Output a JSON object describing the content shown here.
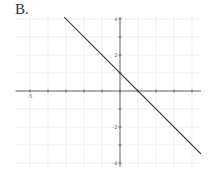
{
  "figure": {
    "option_label": "B."
  },
  "chart_data": {
    "type": "line",
    "title": "",
    "xlabel": "",
    "ylabel": "",
    "xlim": [
      -5.8,
      4.5
    ],
    "ylim": [
      -4.2,
      4.1
    ],
    "grid": true,
    "x_ticks": [
      -5,
      -4,
      -3,
      -2,
      -1,
      0,
      1,
      2,
      3,
      4
    ],
    "y_ticks": [
      -4,
      -3,
      -2,
      -1,
      1,
      2,
      3,
      4
    ],
    "x_tick_labels": [
      {
        "value": -5,
        "text": "-5"
      }
    ],
    "y_tick_labels": [
      {
        "value": 4,
        "text": "4"
      },
      {
        "value": 2,
        "text": "2"
      },
      {
        "value": -2,
        "text": "-2"
      },
      {
        "value": -4,
        "text": "-4"
      }
    ],
    "series": [
      {
        "name": "y = -x + 1",
        "equation": "y = -x + 1",
        "slope": -1,
        "y_intercept": 1,
        "x_intercept": 1,
        "x": [
          -3.1,
          4.5
        ],
        "y": [
          4.1,
          -3.5
        ]
      }
    ],
    "colors": {
      "line": "#3a3a3a",
      "axis": "#555555",
      "grid": "#e6e6e6"
    }
  }
}
